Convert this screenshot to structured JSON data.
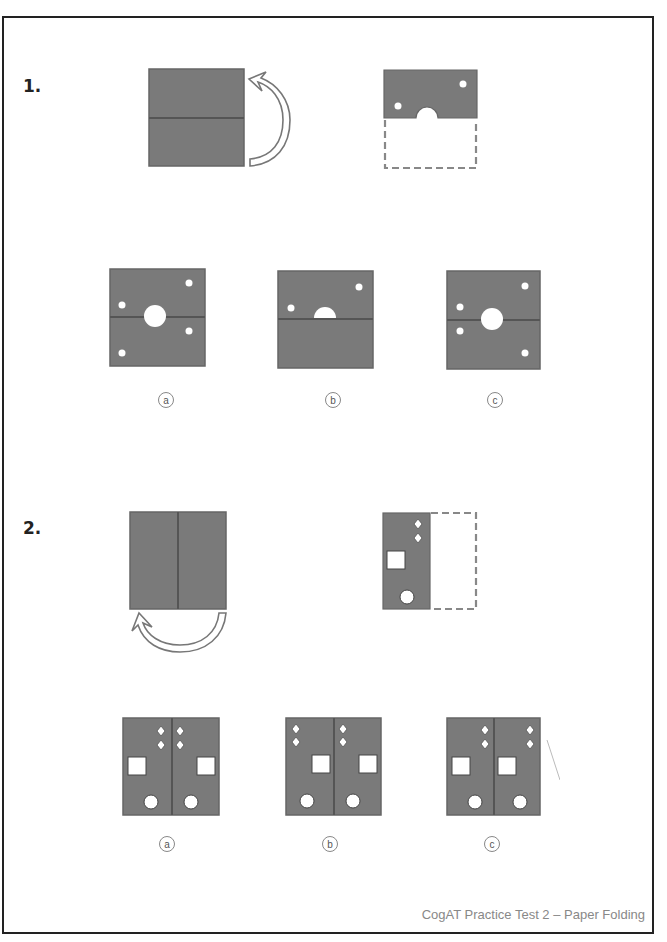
{
  "page": {
    "footer": "CogAT Practice Test 2 – Paper Folding",
    "colors": {
      "paper": "#7a7a7a",
      "fold_line": "#555555",
      "hole": "#ffffff",
      "frame": "#222222"
    }
  },
  "questions": [
    {
      "number": "1.",
      "fold": "bottom half folded up over top half",
      "options": [
        {
          "label": "a",
          "description": "unfolded square, full center circle, two dots upper half, two dots lower half mirrored"
        },
        {
          "label": "b",
          "description": "unfolded square, half circle above fold, two dots in upper half only"
        },
        {
          "label": "c",
          "description": "unfolded square, full center circle, dots placed asymmetric"
        }
      ]
    },
    {
      "number": "2.",
      "fold": "right half folded over to left half",
      "options": [
        {
          "label": "a",
          "description": "diamonds near fold, squares at outer edges, circles near fold"
        },
        {
          "label": "b",
          "description": "diamonds left of each half, squares right of each half"
        },
        {
          "label": "c",
          "description": "diamonds right of each half, squares same orientation"
        }
      ]
    }
  ]
}
